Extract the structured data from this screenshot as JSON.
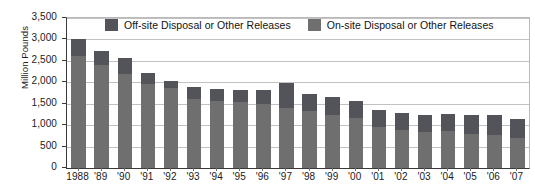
{
  "chart_data": {
    "type": "bar",
    "subtype": "stacked-vertical",
    "title": "",
    "xlabel": "",
    "ylabel": "Million Pounds",
    "ylim": [
      0,
      3500
    ],
    "ytick_values": [
      0,
      500,
      1000,
      1500,
      2000,
      2500,
      3000,
      3500
    ],
    "ytick_labels": [
      "0",
      "500",
      "1,000",
      "1,500",
      "2,000",
      "2,500",
      "3,000",
      "3,500"
    ],
    "grid": true,
    "grid_axis": "y",
    "legend_position": "top-center-inside",
    "categories": [
      "1988",
      "'89",
      "'90",
      "'91",
      "'92",
      "'93",
      "'94",
      "'95",
      "'96",
      "'97",
      "'98",
      "'99",
      "'00",
      "'01",
      "'02",
      "'03",
      "'04",
      "'05",
      "'06",
      "'07"
    ],
    "series": [
      {
        "name": "On-site Disposal or Other Releases",
        "color": "#6f6f6f",
        "stack_position": "bottom",
        "values": [
          2620,
          2410,
          2190,
          1960,
          1870,
          1620,
          1570,
          1530,
          1500,
          1410,
          1330,
          1240,
          1160,
          960,
          890,
          840,
          860,
          790,
          760,
          690
        ]
      },
      {
        "name": "Off-site Disposal or Other Releases",
        "color": "#53535a",
        "stack_position": "top",
        "values": [
          380,
          320,
          370,
          250,
          160,
          260,
          270,
          290,
          310,
          580,
          390,
          410,
          410,
          390,
          390,
          400,
          400,
          440,
          470,
          455
        ]
      }
    ],
    "totals": [
      3000,
      2730,
      2560,
      2210,
      2030,
      1880,
      1840,
      1820,
      1810,
      1990,
      1720,
      1650,
      1570,
      1350,
      1280,
      1240,
      1260,
      1230,
      1230,
      1145
    ]
  },
  "legend": {
    "entries": [
      {
        "label": "Off-site Disposal or Other Releases",
        "swatch": "off-site-swatch"
      },
      {
        "label": "On-site Disposal or Other Releases",
        "swatch": "on-site-swatch"
      }
    ]
  },
  "axes": {
    "y_title": "Million Pounds"
  }
}
